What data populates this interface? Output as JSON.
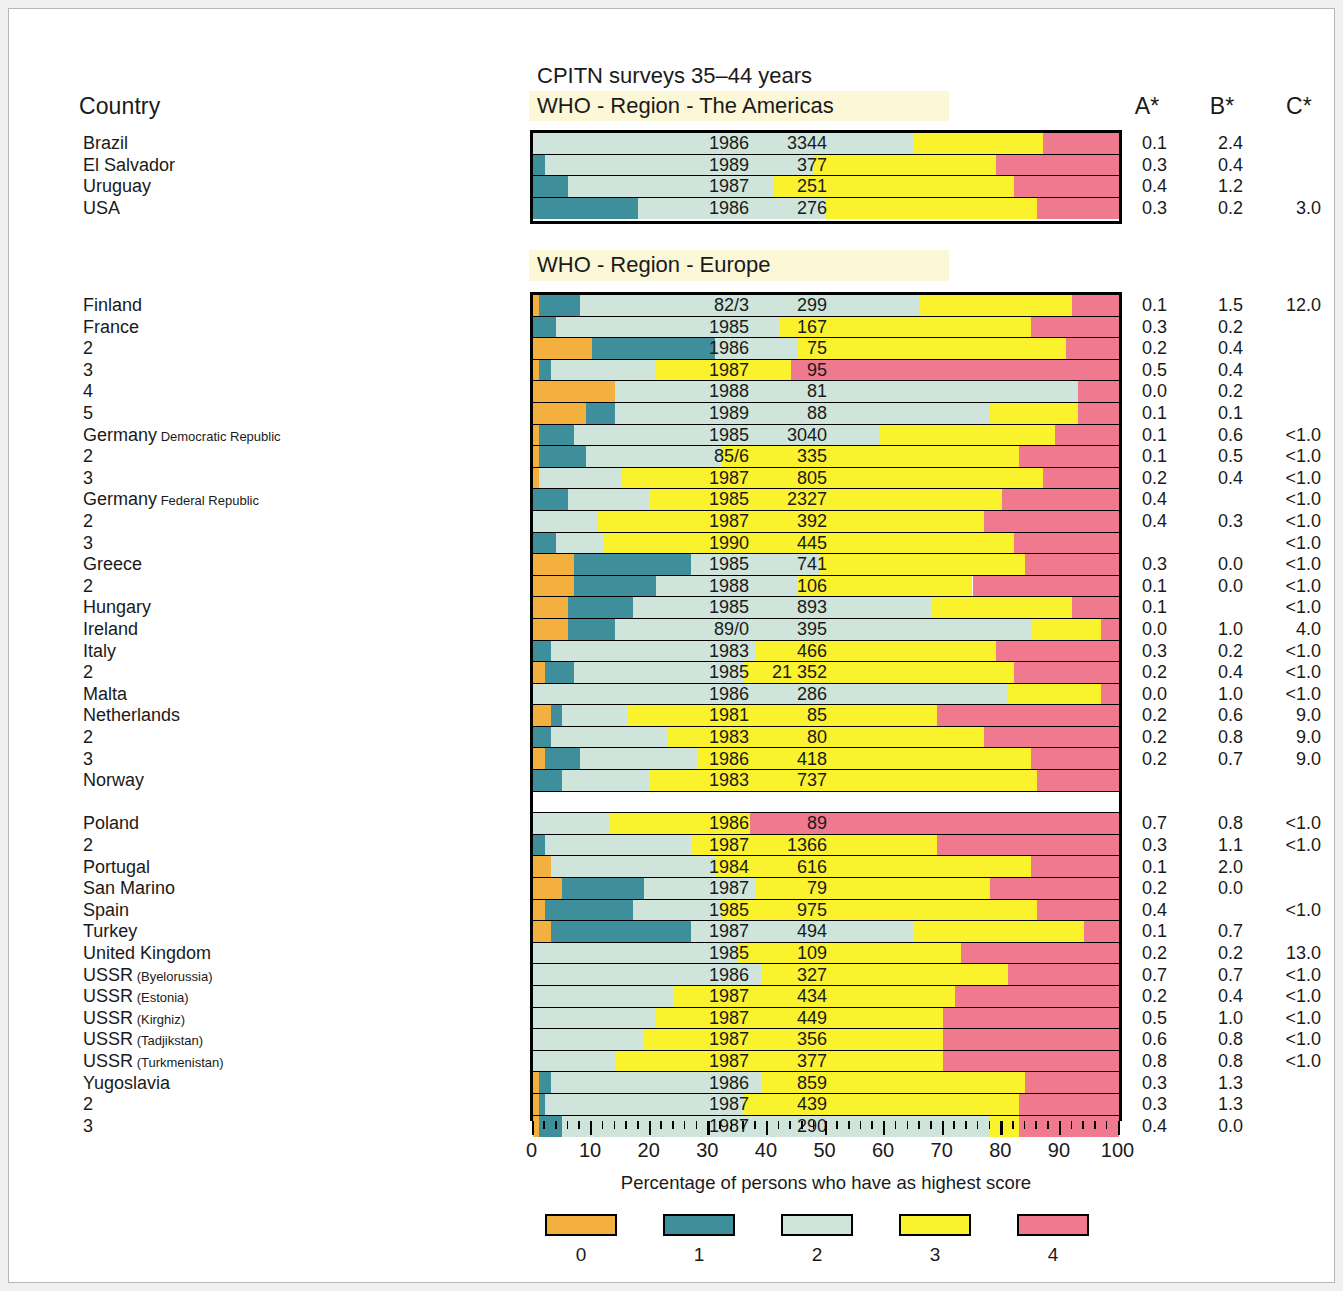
{
  "header": {
    "country_label": "Country",
    "year_label": "Year",
    "n_label": "N",
    "a_label": "A*",
    "b_label": "B*",
    "c_label": "C*"
  },
  "chart_title": "CPITN surveys 35–44 years",
  "axis": {
    "caption": "Percentage of persons who have as highest score",
    "ticks": [
      "0",
      "10",
      "20",
      "30",
      "40",
      "50",
      "60",
      "70",
      "80",
      "90",
      "100"
    ],
    "min": 0,
    "max": 100
  },
  "legend": {
    "items": [
      {
        "label": "0",
        "color": "#f3b03f"
      },
      {
        "label": "1",
        "color": "#3e8e9b"
      },
      {
        "label": "2",
        "color": "#cfe5dc"
      },
      {
        "label": "3",
        "color": "#fbf22e"
      },
      {
        "label": "4",
        "color": "#ef798f"
      }
    ]
  },
  "regions": [
    {
      "id": "americas",
      "title": "WHO - Region - The Americas"
    },
    {
      "id": "europe",
      "title": "WHO - Region - Europe"
    }
  ],
  "chart_data": {
    "type": "bar",
    "subtype": "stacked-horizontal-100",
    "title": "CPITN surveys 35–44 years",
    "xlabel": "Percentage of persons who have as highest score",
    "ylabel": "",
    "xlim": [
      0,
      100
    ],
    "grid": false,
    "legend_position": "bottom",
    "series": [
      {
        "name": "0",
        "color": "#f3b03f"
      },
      {
        "name": "1",
        "color": "#3e8e9b"
      },
      {
        "name": "2",
        "color": "#cfe5dc"
      },
      {
        "name": "3",
        "color": "#fbf22e"
      },
      {
        "name": "4",
        "color": "#ef798f"
      }
    ],
    "columns": [
      "Country",
      "Year",
      "N",
      "A*",
      "B*",
      "C*"
    ],
    "groups": [
      {
        "region": "WHO - Region - The Americas",
        "rows": [
          {
            "country": "Brazil",
            "sub": "",
            "year": "1986",
            "n": "3344",
            "a": "0.1",
            "b": "2.4",
            "c": "",
            "values": [
              0,
              0,
              65,
              22,
              13
            ]
          },
          {
            "country": "El Salvador",
            "sub": "",
            "year": "1989",
            "n": "377",
            "a": "0.3",
            "b": "0.4",
            "c": "",
            "values": [
              0,
              2,
              46,
              31,
              21
            ]
          },
          {
            "country": "Uruguay",
            "sub": "",
            "year": "1987",
            "n": "251",
            "a": "0.4",
            "b": "1.2",
            "c": "",
            "values": [
              0,
              6,
              35,
              41,
              18
            ]
          },
          {
            "country": "USA",
            "sub": "",
            "year": "1986",
            "n": "276",
            "a": "0.3",
            "b": "0.2",
            "c": "3.0",
            "values": [
              0,
              18,
              32,
              36,
              14
            ]
          }
        ]
      },
      {
        "region": "WHO - Region - Europe",
        "rows": [
          {
            "country": "Finland",
            "sub": "",
            "year": "82/3",
            "n": "299",
            "a": "0.1",
            "b": "1.5",
            "c": "12.0",
            "values": [
              1,
              7,
              58,
              26,
              8
            ]
          },
          {
            "country": "France",
            "sub": "",
            "year": "1985",
            "n": "167",
            "a": "0.3",
            "b": "0.2",
            "c": "",
            "values": [
              0,
              4,
              38,
              43,
              15
            ]
          },
          {
            "country": "2",
            "sub": "",
            "year": "1986",
            "n": "75",
            "a": "0.2",
            "b": "0.4",
            "c": "",
            "values": [
              10,
              21,
              14,
              46,
              9
            ]
          },
          {
            "country": "3",
            "sub": "",
            "year": "1987",
            "n": "95",
            "a": "0.5",
            "b": "0.4",
            "c": "",
            "values": [
              1,
              2,
              18,
              23,
              56
            ]
          },
          {
            "country": "4",
            "sub": "",
            "year": "1988",
            "n": "81",
            "a": "0.0",
            "b": "0.2",
            "c": "",
            "values": [
              14,
              0,
              79,
              0,
              7
            ]
          },
          {
            "country": "5",
            "sub": "",
            "year": "1989",
            "n": "88",
            "a": "0.1",
            "b": "0.1",
            "c": "",
            "values": [
              9,
              5,
              64,
              15,
              7
            ]
          },
          {
            "country": "Germany",
            "sub": "Democratic Republic",
            "year": "1985",
            "n": "3040",
            "a": "0.1",
            "b": "0.6",
            "c": "<1.0",
            "values": [
              1,
              6,
              52,
              30,
              11
            ]
          },
          {
            "country": "2",
            "sub": "",
            "year": "85/6",
            "n": "335",
            "a": "0.1",
            "b": "0.5",
            "c": "<1.0",
            "values": [
              1,
              8,
              23,
              51,
              17
            ]
          },
          {
            "country": "3",
            "sub": "",
            "year": "1987",
            "n": "805",
            "a": "0.2",
            "b": "0.4",
            "c": "<1.0",
            "values": [
              1,
              0,
              14,
              72,
              13
            ]
          },
          {
            "country": "Germany",
            "sub": "Federal Republic",
            "year": "1985",
            "n": "2327",
            "a": "0.4",
            "b": "",
            "c": "<1.0",
            "values": [
              0,
              6,
              14,
              60,
              20
            ]
          },
          {
            "country": "2",
            "sub": "",
            "year": "1987",
            "n": "392",
            "a": "0.4",
            "b": "0.3",
            "c": "<1.0",
            "values": [
              0,
              0,
              11,
              66,
              23
            ]
          },
          {
            "country": "3",
            "sub": "",
            "year": "1990",
            "n": "445",
            "a": "",
            "b": "",
            "c": "<1.0",
            "values": [
              0,
              4,
              8,
              70,
              18
            ]
          },
          {
            "country": "Greece",
            "sub": "",
            "year": "1985",
            "n": "741",
            "a": "0.3",
            "b": "0.0",
            "c": "<1.0",
            "values": [
              7,
              20,
              22,
              35,
              16
            ]
          },
          {
            "country": "2",
            "sub": "",
            "year": "1988",
            "n": "106",
            "a": "0.1",
            "b": "0.0",
            "c": "<1.0",
            "values": [
              7,
              14,
              24,
              30,
              25
            ]
          },
          {
            "country": "Hungary",
            "sub": "",
            "year": "1985",
            "n": "893",
            "a": "0.1",
            "b": "",
            "c": "<1.0",
            "values": [
              6,
              11,
              51,
              24,
              8
            ]
          },
          {
            "country": "Ireland",
            "sub": "",
            "year": "89/0",
            "n": "395",
            "a": "0.0",
            "b": "1.0",
            "c": "4.0",
            "values": [
              6,
              8,
              71,
              12,
              3
            ]
          },
          {
            "country": "Italy",
            "sub": "",
            "year": "1983",
            "n": "466",
            "a": "0.3",
            "b": "0.2",
            "c": "<1.0",
            "values": [
              0,
              3,
              35,
              41,
              21
            ]
          },
          {
            "country": "2",
            "sub": "",
            "year": "1985",
            "n": "21 352",
            "a": "0.2",
            "b": "0.4",
            "c": "<1.0",
            "values": [
              2,
              5,
              29,
              46,
              18
            ]
          },
          {
            "country": "Malta",
            "sub": "",
            "year": "1986",
            "n": "286",
            "a": "0.0",
            "b": "1.0",
            "c": "<1.0",
            "values": [
              0,
              0,
              81,
              16,
              3
            ]
          },
          {
            "country": "Netherlands",
            "sub": "",
            "year": "1981",
            "n": "85",
            "a": "0.2",
            "b": "0.6",
            "c": "9.0",
            "values": [
              3,
              2,
              11,
              53,
              31
            ]
          },
          {
            "country": "2",
            "sub": "",
            "year": "1983",
            "n": "80",
            "a": "0.2",
            "b": "0.8",
            "c": "9.0",
            "values": [
              0,
              3,
              20,
              54,
              23
            ]
          },
          {
            "country": "3",
            "sub": "",
            "year": "1986",
            "n": "418",
            "a": "0.2",
            "b": "0.7",
            "c": "9.0",
            "values": [
              2,
              6,
              20,
              57,
              15
            ]
          },
          {
            "country": "Norway",
            "sub": "",
            "year": "1983",
            "n": "737",
            "a": "",
            "b": "",
            "c": "",
            "values": [
              0,
              5,
              15,
              66,
              14
            ]
          },
          {
            "country": "Poland",
            "sub": "",
            "year": "1986",
            "n": "89",
            "a": "0.7",
            "b": "0.8",
            "c": "<1.0",
            "values": [
              0,
              0,
              13,
              24,
              63
            ]
          },
          {
            "country": "2",
            "sub": "",
            "year": "1987",
            "n": "1366",
            "a": "0.3",
            "b": "1.1",
            "c": "<1.0",
            "values": [
              0,
              2,
              25,
              42,
              31
            ]
          },
          {
            "country": "Portugal",
            "sub": "",
            "year": "1984",
            "n": "616",
            "a": "0.1",
            "b": "2.0",
            "c": "",
            "values": [
              3,
              0,
              28,
              54,
              15
            ]
          },
          {
            "country": "San Marino",
            "sub": "",
            "year": "1987",
            "n": "79",
            "a": "0.2",
            "b": "0.0",
            "c": "",
            "values": [
              5,
              14,
              19,
              40,
              22
            ]
          },
          {
            "country": "Spain",
            "sub": "",
            "year": "1985",
            "n": "975",
            "a": "0.4",
            "b": "",
            "c": "<1.0",
            "values": [
              2,
              15,
              15,
              54,
              14
            ]
          },
          {
            "country": "Turkey",
            "sub": "",
            "year": "1987",
            "n": "494",
            "a": "0.1",
            "b": "0.7",
            "c": "",
            "values": [
              3,
              24,
              38,
              29,
              6
            ]
          },
          {
            "country": "United Kingdom",
            "sub": "",
            "year": "1985",
            "n": "109",
            "a": "0.2",
            "b": "0.2",
            "c": "13.0",
            "values": [
              0,
              0,
              35,
              38,
              27
            ]
          },
          {
            "country": "USSR",
            "sub": "(Byelorussia)",
            "year": "1986",
            "n": "327",
            "a": "0.7",
            "b": "0.7",
            "c": "<1.0",
            "values": [
              0,
              0,
              39,
              42,
              19
            ]
          },
          {
            "country": "USSR",
            "sub": "(Estonia)",
            "year": "1987",
            "n": "434",
            "a": "0.2",
            "b": "0.4",
            "c": "<1.0",
            "values": [
              0,
              0,
              24,
              48,
              28
            ]
          },
          {
            "country": "USSR",
            "sub": "(Kirghiz)",
            "year": "1987",
            "n": "449",
            "a": "0.5",
            "b": "1.0",
            "c": "<1.0",
            "values": [
              0,
              0,
              21,
              49,
              30
            ]
          },
          {
            "country": "USSR",
            "sub": "(Tadjikstan)",
            "year": "1987",
            "n": "356",
            "a": "0.6",
            "b": "0.8",
            "c": "<1.0",
            "values": [
              0,
              0,
              19,
              51,
              30
            ]
          },
          {
            "country": "USSR",
            "sub": "(Turkmenistan)",
            "year": "1987",
            "n": "377",
            "a": "0.8",
            "b": "0.8",
            "c": "<1.0",
            "values": [
              0,
              0,
              14,
              56,
              30
            ]
          },
          {
            "country": "Yugoslavia",
            "sub": "",
            "year": "1986",
            "n": "859",
            "a": "0.3",
            "b": "1.3",
            "c": "",
            "values": [
              1,
              2,
              36,
              45,
              16
            ]
          },
          {
            "country": "2",
            "sub": "",
            "year": "1987",
            "n": "439",
            "a": "0.3",
            "b": "1.3",
            "c": "",
            "values": [
              1,
              1,
              34,
              47,
              17
            ]
          },
          {
            "country": "3",
            "sub": "",
            "year": "1987",
            "n": "290",
            "a": "0.4",
            "b": "0.0",
            "c": "",
            "values": [
              1,
              4,
              73,
              5,
              17
            ]
          }
        ]
      }
    ]
  }
}
